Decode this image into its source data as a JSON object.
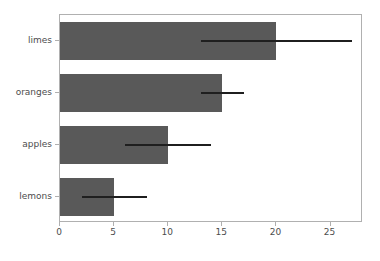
{
  "chart_data": {
    "type": "bar",
    "orientation": "horizontal",
    "title": "",
    "xlabel": "",
    "ylabel": "",
    "categories": [
      "lemons",
      "apples",
      "oranges",
      "limes"
    ],
    "values": [
      5,
      10,
      15,
      20
    ],
    "errors_low": [
      2,
      6,
      13,
      13
    ],
    "errors_high": [
      8,
      14,
      17,
      27
    ],
    "xlim": [
      0,
      28
    ],
    "ylim": [
      -0.5,
      3.5
    ],
    "xticks": [
      0,
      5,
      10,
      15,
      20,
      25
    ],
    "xtick_labels": [
      "0",
      "5",
      "10",
      "15",
      "20",
      "25"
    ],
    "ytick_labels": [
      "lemons",
      "apples",
      "oranges",
      "limes"
    ],
    "grid": false,
    "legend": null,
    "bar_color": "#595959",
    "error_color": "#1f1f1f",
    "axis_color": "#b0b0b0",
    "tick_label_color": "#4d4d4d",
    "background_color": "#ffffff",
    "bar_height_fraction": 0.72
  }
}
